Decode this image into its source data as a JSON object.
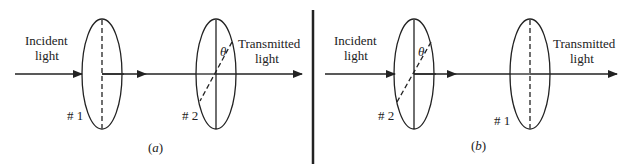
{
  "figure": {
    "panels": [
      {
        "id": "a",
        "caption": "(a)",
        "incident_label": [
          "Incident",
          "light"
        ],
        "transmitted_label": [
          "Transmitted",
          "light"
        ],
        "polarizers": [
          {
            "label": "# 1",
            "axis": "vertical-dashed"
          },
          {
            "label": "# 2",
            "axis": "vertical-solid-with-dashed-angled",
            "angle_label": "θ"
          }
        ]
      },
      {
        "id": "b",
        "caption": "(b)",
        "incident_label": [
          "Incident",
          "light"
        ],
        "transmitted_label": [
          "Transmitted",
          "light"
        ],
        "polarizers": [
          {
            "label": "# 2",
            "axis": "vertical-solid-with-dashed-angled",
            "angle_label": "θ"
          },
          {
            "label": "# 1",
            "axis": "vertical-dashed"
          }
        ]
      }
    ],
    "colors": {
      "ink": "#222222",
      "background": "#ffffff"
    }
  }
}
